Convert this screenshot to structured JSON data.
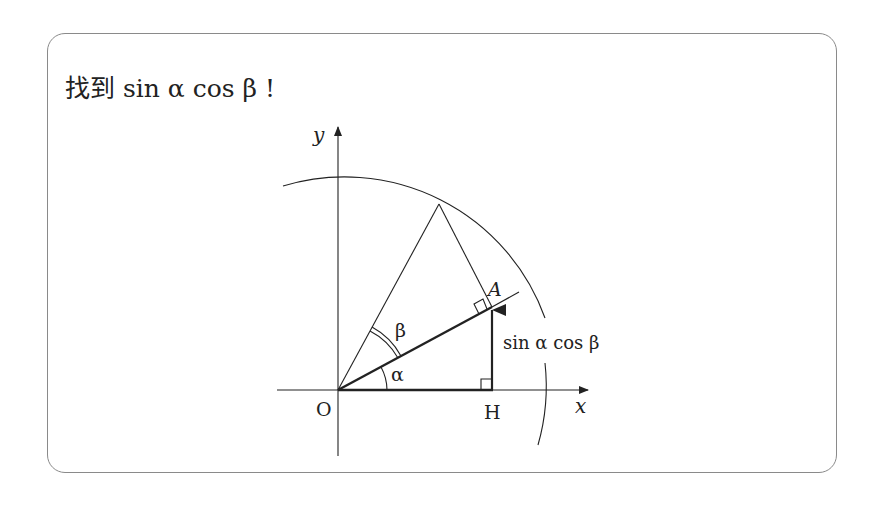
{
  "title": "找到 sin α cos β !",
  "diagram": {
    "axes": {
      "x_label": "x",
      "y_label": "y"
    },
    "points": {
      "origin": "O",
      "a": "A",
      "h": "H"
    },
    "angles": {
      "alpha": "α",
      "beta": "β"
    },
    "segment_label": "sin α cos β",
    "colors": {
      "stroke": "#222222",
      "border": "#8a8a8a",
      "background": "#ffffff"
    }
  }
}
